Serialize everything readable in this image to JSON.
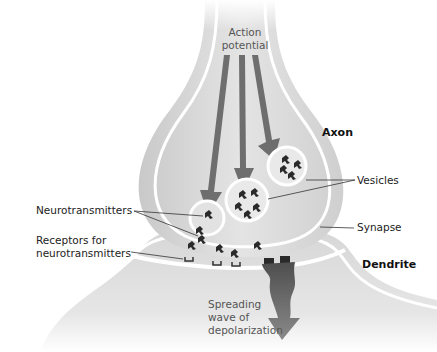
{
  "labels": {
    "action_potential_line1": "Action",
    "action_potential_line2": "potential",
    "axon": "Axon",
    "vesicles": "Vesicles",
    "neurotransmitters": "Neurotransmitters",
    "synapse": "Synapse",
    "receptors_line1": "Receptors for",
    "receptors_line2": "neurotransmitters",
    "dendrite": "Dendrite",
    "spreading_line1": "Spreading",
    "spreading_line2": "wave of",
    "spreading_line3": "depolarization"
  },
  "colors": {
    "membrane_fill": "#e2e2e2",
    "membrane_shadow": "#c4c4c4",
    "membrane_edge": "#ffffff",
    "arrow": "#6e6e6e",
    "depolarization": "#5a5a5a",
    "neurotransmitter": "#2a2a2a",
    "leader_line": "#333333"
  }
}
